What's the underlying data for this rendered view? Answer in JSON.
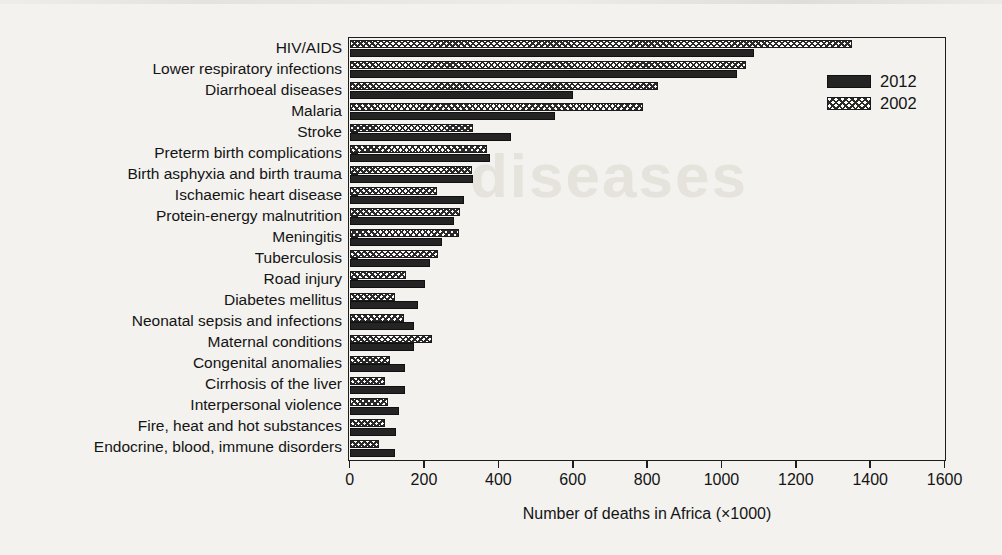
{
  "chart_data": {
    "type": "bar",
    "orientation": "horizontal",
    "title": "",
    "xlabel": "Number of deaths in Africa (×1000)",
    "ylabel": "",
    "xlim": [
      0,
      1600
    ],
    "xticks": [
      0,
      200,
      400,
      600,
      800,
      1000,
      1200,
      1400,
      1600
    ],
    "grid": false,
    "legend_position": "top-right",
    "categories": [
      "HIV/AIDS",
      "Lower respiratory infections",
      "Diarrhoeal diseases",
      "Malaria",
      "Stroke",
      "Preterm birth complications",
      "Birth asphyxia and birth trauma",
      "Ischaemic heart disease",
      "Protein-energy malnutrition",
      "Meningitis",
      "Tuberculosis",
      "Road injury",
      "Diabetes mellitus",
      "Neonatal sepsis and infections",
      "Maternal conditions",
      "Congenital anomalies",
      "Cirrhosis of the liver",
      "Interpersonal violence",
      "Fire, heat and hot substances",
      "Endocrine, blood, immune disorders"
    ],
    "series": [
      {
        "name": "2012",
        "color": "#242424",
        "pattern": "solid",
        "values": [
          1088,
          1043,
          600,
          552,
          434,
          378,
          333,
          308,
          280,
          249,
          217,
          204,
          183,
          172,
          174,
          150,
          148,
          134,
          126,
          123
        ]
      },
      {
        "name": "2002",
        "color": "#fdfdfb",
        "pattern": "crosshatch",
        "values": [
          1351,
          1067,
          828,
          788,
          333,
          370,
          330,
          236,
          298,
          293,
          237,
          153,
          123,
          145,
          222,
          108,
          96,
          102,
          94,
          78
        ]
      }
    ]
  },
  "legend": {
    "entries": [
      {
        "label": "2012",
        "swatch": "solid-black-swatch"
      },
      {
        "label": "2002",
        "swatch": "crosshatch-swatch"
      }
    ]
  },
  "axis": {
    "x_title": "Number of deaths in Africa (×1000)",
    "x_tick_labels": [
      "0",
      "200",
      "400",
      "600",
      "800",
      "1000",
      "1200",
      "1400",
      "1600"
    ]
  },
  "scan": {
    "ghost_text": "diseases"
  }
}
